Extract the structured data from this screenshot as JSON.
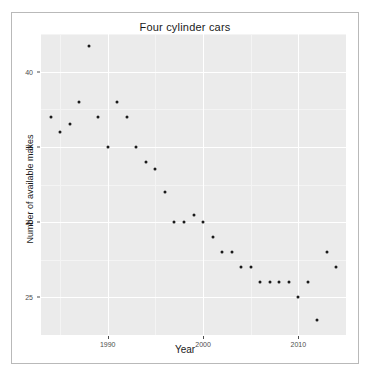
{
  "figure": {
    "title": "Four cylinder cars",
    "background": "#ffffff",
    "panel_background": "#ebebeb",
    "point_color": "#1a1a1a",
    "grid_color": "#ffffff"
  },
  "chart_data": {
    "type": "scatter",
    "title": "Four cylinder cars",
    "xlabel": "Year",
    "ylabel": "Number of available makes",
    "xlim": [
      1983,
      2015
    ],
    "ylim": [
      22.5,
      42.5
    ],
    "grid": true,
    "legend": null,
    "xticks": [
      1990,
      2000,
      2010
    ],
    "xtick_labels": [
      "1990",
      "2000",
      "2010"
    ],
    "yticks": [
      25,
      30,
      35,
      40
    ],
    "ytick_labels": [
      "25",
      "30",
      "35",
      "40"
    ],
    "x": [
      1984,
      1985,
      1986,
      1987,
      1988,
      1989,
      1990,
      1991,
      1992,
      1993,
      1994,
      1995,
      1996,
      1997,
      1998,
      1999,
      2000,
      2001,
      2002,
      2003,
      2004,
      2005,
      2006,
      2007,
      2008,
      2009,
      2010,
      2011,
      2012,
      2013,
      2014
    ],
    "values": [
      37,
      36,
      36.5,
      38,
      41.7,
      37,
      35,
      38,
      37,
      35,
      34,
      33.5,
      32,
      30,
      30,
      30.5,
      30,
      29,
      28,
      28,
      27,
      27,
      26,
      26,
      26,
      26,
      25,
      26,
      23.5,
      28,
      27
    ],
    "series": [
      {
        "name": "Four cylinder cars",
        "points": [
          {
            "year": 1984,
            "makes": 37
          },
          {
            "year": 1985,
            "makes": 36
          },
          {
            "year": 1986,
            "makes": 36.5
          },
          {
            "year": 1987,
            "makes": 38
          },
          {
            "year": 1988,
            "makes": 41.7
          },
          {
            "year": 1989,
            "makes": 37
          },
          {
            "year": 1990,
            "makes": 35
          },
          {
            "year": 1991,
            "makes": 38
          },
          {
            "year": 1992,
            "makes": 37
          },
          {
            "year": 1993,
            "makes": 35
          },
          {
            "year": 1994,
            "makes": 34
          },
          {
            "year": 1995,
            "makes": 33.5
          },
          {
            "year": 1996,
            "makes": 32
          },
          {
            "year": 1997,
            "makes": 30
          },
          {
            "year": 1998,
            "makes": 30
          },
          {
            "year": 1999,
            "makes": 30.5
          },
          {
            "year": 2000,
            "makes": 30
          },
          {
            "year": 2001,
            "makes": 29
          },
          {
            "year": 2002,
            "makes": 28
          },
          {
            "year": 2003,
            "makes": 28
          },
          {
            "year": 2004,
            "makes": 27
          },
          {
            "year": 2005,
            "makes": 27
          },
          {
            "year": 2006,
            "makes": 26
          },
          {
            "year": 2007,
            "makes": 26
          },
          {
            "year": 2008,
            "makes": 26
          },
          {
            "year": 2009,
            "makes": 26
          },
          {
            "year": 2010,
            "makes": 25
          },
          {
            "year": 2011,
            "makes": 26
          },
          {
            "year": 2012,
            "makes": 23.5
          },
          {
            "year": 2013,
            "makes": 28
          },
          {
            "year": 2014,
            "makes": 27
          }
        ]
      }
    ]
  }
}
